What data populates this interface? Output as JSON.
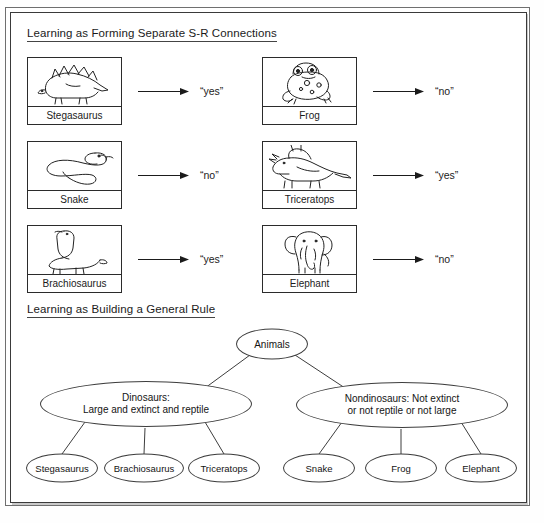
{
  "figure": {
    "sections": [
      {
        "id": "sr",
        "title": "Learning as Forming Separate S-R Connections"
      },
      {
        "id": "rule",
        "title": "Learning as Building a General Rule"
      }
    ]
  },
  "sr_section": {
    "title": "Learning as Forming Separate S-R Connections",
    "cards": [
      {
        "label": "Stegasaurus",
        "icon": "stegosaurus-icon",
        "response": "“yes”",
        "column": "left",
        "row": 0
      },
      {
        "label": "Snake",
        "icon": "snake-icon",
        "response": "“no”",
        "column": "left",
        "row": 1
      },
      {
        "label": "Brachiosaurus",
        "icon": "brachiosaurus-icon",
        "response": "“yes”",
        "column": "left",
        "row": 2
      },
      {
        "label": "Frog",
        "icon": "frog-icon",
        "response": "“no”",
        "column": "right",
        "row": 0
      },
      {
        "label": "Triceratops",
        "icon": "triceratops-icon",
        "response": "“yes”",
        "column": "right",
        "row": 1
      },
      {
        "label": "Elephant",
        "icon": "elephant-icon",
        "response": "“no”",
        "column": "right",
        "row": 2
      }
    ]
  },
  "rule_section": {
    "title": "Learning as Building a General Rule",
    "root": {
      "label": "Animals"
    },
    "branches": [
      {
        "label": "Dinosaurs:\nLarge and extinct and reptile"
      },
      {
        "label": "Nondinosaurs: Not extinct\nor not reptile or not large"
      }
    ],
    "leaves": [
      {
        "label": "Stegasaurus",
        "parent": "Dinosaurs"
      },
      {
        "label": "Brachiosaurus",
        "parent": "Dinosaurs"
      },
      {
        "label": "Triceratops",
        "parent": "Dinosaurs"
      },
      {
        "label": "Snake",
        "parent": "Nondinosaurs"
      },
      {
        "label": "Frog",
        "parent": "Nondinosaurs"
      },
      {
        "label": "Elephant",
        "parent": "Nondinosaurs"
      }
    ]
  },
  "colors": {
    "frame": "#3a3a3a",
    "outer_frame": "#6f6f6f",
    "ink": "#1b1b1b",
    "node_stroke": "#3d3d3d",
    "paper": "#ffffff"
  }
}
